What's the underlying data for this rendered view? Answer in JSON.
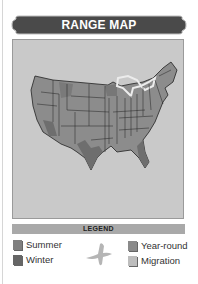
{
  "header": {
    "title": "RANGE MAP"
  },
  "map": {
    "region": "contiguous-united-states",
    "icon": "us-map-icon",
    "colors": {
      "background": "#c9c9c9",
      "year_round": "#8c8c8c",
      "winter": "#6e6e6e",
      "lakes": "#e6e6e6"
    }
  },
  "legend": {
    "title": "LEGEND",
    "bird_icon": "bird-silhouette-icon",
    "items": [
      {
        "label": "Summer",
        "color": "#7f7f7f"
      },
      {
        "label": "Winter",
        "color": "#666666"
      },
      {
        "label": "Year-round",
        "color": "#8a8a8a"
      },
      {
        "label": "Migration",
        "color": "#bdbdbd"
      }
    ]
  }
}
